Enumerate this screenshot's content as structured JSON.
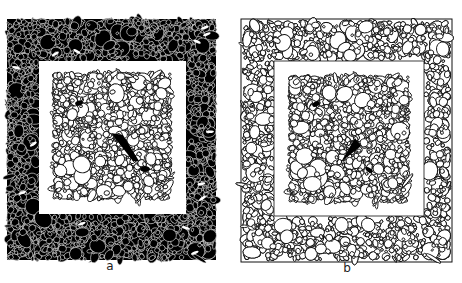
{
  "figure": {
    "panels": [
      {
        "id": "a",
        "label": "a",
        "style": "inverted",
        "outer": {
          "x": 7,
          "y": 19,
          "w": 209,
          "h": 241,
          "fill": "#000000",
          "stroke": "#ffffff"
        },
        "inner_frame": {
          "x": 39,
          "y": 61,
          "w": 147,
          "h": 153
        },
        "core": {
          "x": 53,
          "y": 73,
          "w": 118,
          "h": 126
        },
        "label_pos": {
          "x": 100,
          "y": 266
        }
      },
      {
        "id": "b",
        "label": "b",
        "style": "outline",
        "outer": {
          "x": 241,
          "y": 19,
          "w": 211,
          "h": 243,
          "fill": "#ffffff",
          "stroke": "#111111"
        },
        "inner_frame": {
          "x": 274,
          "y": 61,
          "w": 150,
          "h": 155
        },
        "core": {
          "x": 289,
          "y": 76,
          "w": 120,
          "h": 126
        },
        "label_pos": {
          "x": 339,
          "y": 268
        }
      }
    ]
  }
}
